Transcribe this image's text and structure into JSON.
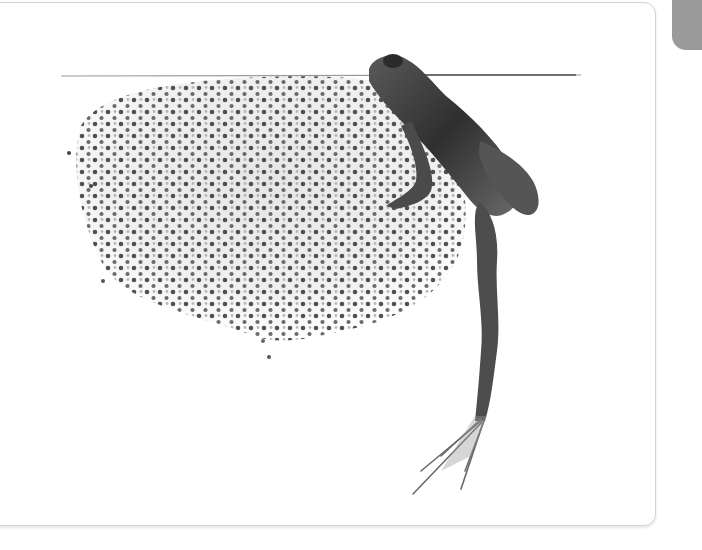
{
  "image": {
    "subject": "frog-with-frogspawn",
    "style": "grayscale-photo",
    "colors": {
      "background": "#ffffff",
      "card_border": "#d3d3d3",
      "side_tab": "#9a9a9a",
      "frog_dark": "#3a3a3a",
      "spawn_dot": "#4a4a4a"
    }
  }
}
